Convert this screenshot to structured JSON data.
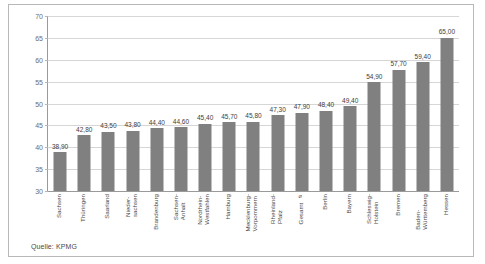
{
  "figure": {
    "source_note": "Quelle: KPMG",
    "bar_color": "#808080",
    "grid_color": "#d6d6d6",
    "axis_color": "#9a9a9a",
    "frame_color": "#b8b8b8",
    "background": "#ffffff"
  },
  "chart_data": {
    "type": "bar",
    "title": "",
    "subtitle": "",
    "xlabel": "",
    "ylabel": "",
    "ylim": [
      30,
      70
    ],
    "yticks": [
      30,
      35,
      40,
      45,
      50,
      55,
      60,
      65,
      70
    ],
    "ytick_labels": [
      "30",
      "35",
      "40",
      "45",
      "50",
      "55",
      "60",
      "65",
      "70"
    ],
    "grid": true,
    "legend": false,
    "legend_position": "none",
    "decimal_separator": ",",
    "categories": [
      "Sachsen",
      "Thüringen",
      "Saarland",
      "Nieder-\nsachsen",
      "Brandenburg",
      "Sachsen-\nAnhalt",
      "Nordrhein-\nWestfahlen",
      "Hamburg",
      "Mecklenburg-\nVorpommern",
      "Rheinland-\nPfalz",
      "Gesamt ⌀",
      "Berlin",
      "Bayern",
      "Schleswig-\nHolstein",
      "Bremen",
      "Baden-\nWürttemberg",
      "Hessen"
    ],
    "values": [
      38.9,
      42.8,
      43.5,
      43.8,
      44.4,
      44.6,
      45.4,
      45.7,
      45.8,
      47.3,
      47.9,
      48.4,
      49.4,
      54.9,
      57.7,
      59.4,
      65.0
    ],
    "value_labels": [
      "38,90",
      "42,80",
      "43,50",
      "43,80",
      "44,40",
      "44,60",
      "45,40",
      "45,70",
      "45,80",
      "47,30",
      "47,90",
      "48,40",
      "49,40",
      "54,90",
      "57,70",
      "59,40",
      "65,00"
    ]
  }
}
